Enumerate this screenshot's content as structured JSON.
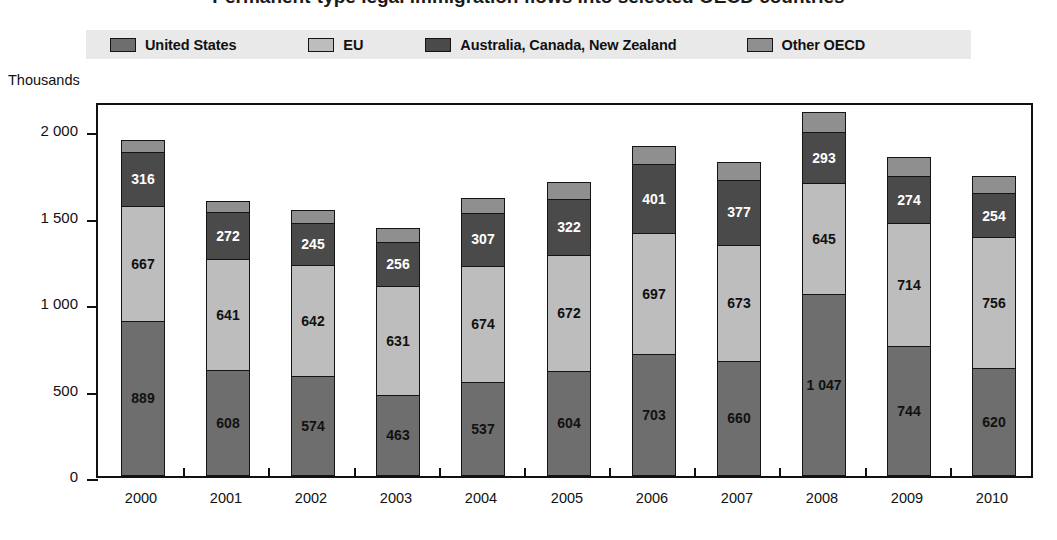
{
  "title": "Permanent-type legal immigration flows into selected OECD countries",
  "legend": {
    "items": [
      {
        "label": "United States",
        "color": "#6e6e6e",
        "key": "united_states"
      },
      {
        "label": "EU",
        "color": "#bdbdbd",
        "key": "eu"
      },
      {
        "label": "Australia, Canada, New Zealand",
        "color": "#4a4a4a",
        "key": "acnz"
      },
      {
        "label": "Other OECD",
        "color": "#8f8f8f",
        "key": "other_oecd"
      }
    ]
  },
  "axis": {
    "unit_caption": "Thousands",
    "y_ticks": [
      "0",
      "500",
      "1 000",
      "1 500",
      "2 000"
    ],
    "y_tick_values": [
      0,
      500,
      1000,
      1500,
      2000
    ]
  },
  "chart_data": {
    "type": "bar",
    "stacked": true,
    "title": "Permanent-type legal immigration flows into selected OECD countries",
    "xlabel": "",
    "ylabel": "Thousands",
    "ylim": [
      0,
      2170
    ],
    "grid": false,
    "legend_position": "top",
    "categories": [
      "2000",
      "2001",
      "2002",
      "2003",
      "2004",
      "2005",
      "2006",
      "2007",
      "2008",
      "2009",
      "2010"
    ],
    "series": [
      {
        "name": "United States",
        "color": "#6e6e6e",
        "label_color": "#111111",
        "values": [
          889,
          608,
          574,
          463,
          537,
          604,
          703,
          660,
          1047,
          744,
          620
        ],
        "labels": [
          "889",
          "608",
          "574",
          "463",
          "537",
          "604",
          "703",
          "660",
          "1 047",
          "744",
          "620"
        ]
      },
      {
        "name": "EU",
        "color": "#bdbdbd",
        "label_color": "#111111",
        "values": [
          667,
          641,
          642,
          631,
          674,
          672,
          697,
          673,
          645,
          714,
          756
        ],
        "labels": [
          "667",
          "641",
          "642",
          "631",
          "674",
          "672",
          "697",
          "673",
          "645",
          "714",
          "756"
        ]
      },
      {
        "name": "Australia, Canada, New Zealand",
        "color": "#4a4a4a",
        "label_color": "#ffffff",
        "values": [
          316,
          272,
          245,
          256,
          307,
          322,
          401,
          377,
          293,
          274,
          254
        ],
        "labels": [
          "316",
          "272",
          "245",
          "256",
          "307",
          "322",
          "401",
          "377",
          "293",
          "274",
          "254"
        ]
      },
      {
        "name": "Other OECD",
        "color": "#8f8f8f",
        "label_color": "#111111",
        "values": [
          63,
          61,
          67,
          78,
          84,
          96,
          101,
          98,
          113,
          105,
          100
        ],
        "labels": [
          "",
          "",
          "",
          "",
          "",
          "",
          "",
          "",
          "",
          "",
          ""
        ]
      }
    ],
    "totals": [
      1935,
      1582,
      1528,
      1428,
      1602,
      1694,
      1902,
      1808,
      2098,
      1837,
      1730
    ]
  }
}
